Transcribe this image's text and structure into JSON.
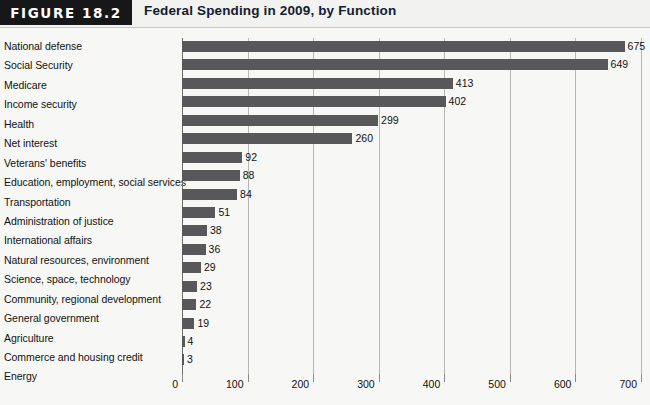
{
  "header": {
    "badge_label": "FIGURE 18.2",
    "title": "Federal Spending in 2009, by Function",
    "badge_color": "#17171a",
    "title_color": "#11202e"
  },
  "chart_data": {
    "type": "bar",
    "orientation": "horizontal",
    "title": "Federal Spending in 2009, by Function",
    "xlabel": "",
    "ylabel": "",
    "xlim": [
      0,
      700
    ],
    "xticks": [
      0,
      100,
      200,
      300,
      400,
      500,
      600,
      700
    ],
    "grid": true,
    "legend": "none",
    "bar_color": "#58585a",
    "categories": [
      "National defense",
      "Social Security",
      "Medicare",
      "Income security",
      "Health",
      "Net interest",
      "Veterans' benefits",
      "Education, employment, social services",
      "Transportation",
      "Administration of justice",
      "International affairs",
      "Natural resources, environment",
      "Science, space, technology",
      "Community, regional development",
      "General government",
      "Agriculture",
      "Commerce and housing credit",
      "Energy"
    ],
    "values": [
      675,
      649,
      413,
      402,
      299,
      260,
      92,
      88,
      84,
      51,
      38,
      36,
      29,
      23,
      22,
      19,
      4,
      3
    ],
    "value_labels": [
      "675",
      "649",
      "413",
      "402",
      "299",
      "260",
      "92",
      "88",
      "84",
      "51",
      "38",
      "36",
      "29",
      "23",
      "22",
      "19",
      "4",
      "3"
    ],
    "xtick_labels": [
      "0",
      "100",
      "200",
      "300",
      "400",
      "500",
      "600",
      "700"
    ]
  }
}
